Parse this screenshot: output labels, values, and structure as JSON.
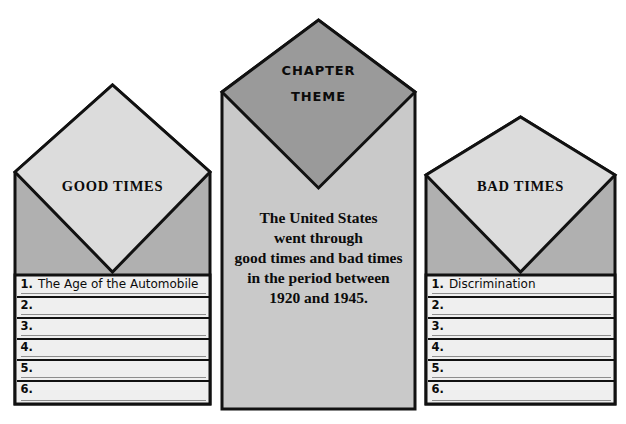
{
  "graphic": {
    "type": "envelope-graphic-organizer",
    "title": "Chapter Theme Envelope Organizer",
    "colors": {
      "page_background": "#ffffff",
      "outline": "#111111",
      "side_flap_light": "#dcdcdc",
      "side_body_gray": "#b0b0b0",
      "center_flap_dark": "#9a9a9a",
      "center_body_gray": "#c9c9c9",
      "row_fill": "#efefef",
      "row_rule": "#8d8d8d",
      "text": "#0b0b0b"
    }
  },
  "envelopes": {
    "left": {
      "name": "good-times-envelope",
      "flap_label": "GOOD TIMES",
      "rows": [
        {
          "number": "1.",
          "text": "The Age of the Automobile"
        },
        {
          "number": "2.",
          "text": ""
        },
        {
          "number": "3.",
          "text": ""
        },
        {
          "number": "4.",
          "text": ""
        },
        {
          "number": "5.",
          "text": ""
        },
        {
          "number": "6.",
          "text": ""
        }
      ]
    },
    "center": {
      "name": "chapter-theme-envelope",
      "flap_label_line1": "CHAPTER",
      "flap_label_line2": "THEME",
      "theme_lines": [
        "The United States",
        "went through",
        "good times and bad times",
        "in the period between",
        "1920 and 1945."
      ]
    },
    "right": {
      "name": "bad-times-envelope",
      "flap_label": "BAD TIMES",
      "rows": [
        {
          "number": "1.",
          "text": "Discrimination"
        },
        {
          "number": "2.",
          "text": ""
        },
        {
          "number": "3.",
          "text": ""
        },
        {
          "number": "4.",
          "text": ""
        },
        {
          "number": "5.",
          "text": ""
        },
        {
          "number": "6.",
          "text": ""
        }
      ]
    }
  }
}
